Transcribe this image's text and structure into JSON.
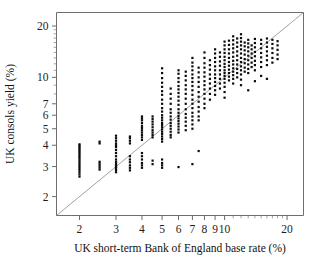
{
  "chart_data": {
    "type": "scatter",
    "title": "",
    "subtitle": "",
    "xlabel": "UK short-term Bank of England base rate (%)",
    "ylabel": "UK consols yield (%)",
    "xscale": "log",
    "yscale": "log",
    "xlim": [
      1.55,
      24.0
    ],
    "ylim": [
      1.55,
      24.0
    ],
    "grid": false,
    "legend": null,
    "legend_position": "none",
    "xticks": [
      2,
      3,
      4,
      5,
      6,
      7,
      8,
      9,
      10,
      20
    ],
    "xtick_labels": [
      "2",
      "3",
      "4",
      "5",
      "6",
      "7",
      "8",
      "9",
      "10",
      "20"
    ],
    "yticks": [
      2,
      3,
      4,
      5,
      6,
      7,
      10,
      20
    ],
    "ytick_labels": [
      "2",
      "3",
      "4",
      "5",
      "6",
      "7",
      "10",
      "20"
    ],
    "annotations": [
      {
        "kind": "reference-line",
        "label": "45-degree line (y = x)",
        "from": [
          1.55,
          1.55
        ],
        "to": [
          24.0,
          24.0
        ]
      }
    ],
    "marker": {
      "shape": "square",
      "color": "#0b0b0b",
      "size": 2.2
    },
    "points": [
      [
        2.0,
        2.62
      ],
      [
        2.0,
        2.7
      ],
      [
        2.0,
        2.78
      ],
      [
        2.0,
        2.86
      ],
      [
        2.0,
        2.94
      ],
      [
        2.0,
        3.02
      ],
      [
        2.0,
        3.1
      ],
      [
        2.0,
        3.18
      ],
      [
        2.0,
        3.26
      ],
      [
        2.0,
        3.34
      ],
      [
        2.0,
        3.42
      ],
      [
        2.0,
        3.5
      ],
      [
        2.0,
        3.58
      ],
      [
        2.0,
        3.66
      ],
      [
        2.0,
        3.74
      ],
      [
        2.0,
        3.82
      ],
      [
        2.0,
        3.9
      ],
      [
        2.0,
        3.98
      ],
      [
        2.0,
        4.05
      ],
      [
        2.5,
        2.88
      ],
      [
        2.5,
        2.96
      ],
      [
        2.5,
        3.04
      ],
      [
        2.5,
        3.12
      ],
      [
        2.5,
        3.2
      ],
      [
        2.5,
        4.1
      ],
      [
        2.5,
        4.2
      ],
      [
        3.0,
        2.78
      ],
      [
        3.0,
        2.86
      ],
      [
        3.0,
        2.94
      ],
      [
        3.0,
        3.0
      ],
      [
        3.0,
        3.05
      ],
      [
        3.0,
        3.12
      ],
      [
        3.0,
        3.2
      ],
      [
        3.0,
        3.3
      ],
      [
        3.0,
        3.45
      ],
      [
        3.0,
        3.6
      ],
      [
        3.0,
        3.75
      ],
      [
        3.0,
        3.9
      ],
      [
        3.0,
        4.0
      ],
      [
        3.0,
        4.1
      ],
      [
        3.0,
        4.25
      ],
      [
        3.0,
        4.4
      ],
      [
        3.0,
        4.55
      ],
      [
        3.5,
        2.85
      ],
      [
        3.5,
        2.95
      ],
      [
        3.5,
        3.05
      ],
      [
        3.5,
        3.18
      ],
      [
        3.5,
        3.3
      ],
      [
        3.5,
        3.45
      ],
      [
        3.5,
        4.1
      ],
      [
        3.5,
        4.25
      ],
      [
        3.5,
        4.4
      ],
      [
        3.5,
        4.5
      ],
      [
        4.0,
        2.95
      ],
      [
        4.0,
        3.05
      ],
      [
        4.0,
        3.15
      ],
      [
        4.0,
        3.3
      ],
      [
        4.0,
        3.45
      ],
      [
        4.0,
        3.6
      ],
      [
        4.0,
        4.3
      ],
      [
        4.0,
        4.45
      ],
      [
        4.0,
        4.6
      ],
      [
        4.0,
        4.75
      ],
      [
        4.0,
        4.9
      ],
      [
        4.0,
        5.05
      ],
      [
        4.0,
        5.2
      ],
      [
        4.0,
        5.4
      ],
      [
        4.0,
        5.6
      ],
      [
        4.0,
        5.75
      ],
      [
        4.0,
        5.9
      ],
      [
        4.5,
        3.1
      ],
      [
        4.5,
        3.25
      ],
      [
        4.5,
        4.45
      ],
      [
        4.5,
        4.6
      ],
      [
        4.5,
        4.75
      ],
      [
        4.5,
        4.9
      ],
      [
        4.5,
        5.1
      ],
      [
        4.5,
        5.3
      ],
      [
        4.5,
        5.5
      ],
      [
        4.5,
        5.7
      ],
      [
        4.5,
        5.9
      ],
      [
        5.0,
        2.95
      ],
      [
        5.0,
        3.05
      ],
      [
        5.0,
        3.15
      ],
      [
        5.0,
        3.3
      ],
      [
        5.0,
        4.2
      ],
      [
        5.0,
        4.35
      ],
      [
        5.0,
        4.5
      ],
      [
        5.0,
        4.65
      ],
      [
        5.0,
        4.8
      ],
      [
        5.0,
        4.95
      ],
      [
        5.0,
        5.1
      ],
      [
        5.0,
        5.25
      ],
      [
        5.0,
        5.4
      ],
      [
        5.0,
        5.6
      ],
      [
        5.0,
        5.8
      ],
      [
        5.0,
        6.0
      ],
      [
        5.0,
        6.3
      ],
      [
        5.0,
        6.6
      ],
      [
        5.0,
        7.0
      ],
      [
        5.0,
        7.4
      ],
      [
        5.0,
        7.9
      ],
      [
        5.0,
        8.3
      ],
      [
        5.0,
        8.8
      ],
      [
        5.0,
        9.3
      ],
      [
        5.0,
        9.9
      ],
      [
        5.0,
        10.6
      ],
      [
        5.0,
        11.3
      ],
      [
        5.5,
        4.45
      ],
      [
        5.5,
        4.6
      ],
      [
        5.5,
        4.8
      ],
      [
        5.5,
        5.0
      ],
      [
        5.5,
        5.2
      ],
      [
        5.5,
        5.4
      ],
      [
        5.5,
        5.65
      ],
      [
        5.5,
        5.9
      ],
      [
        5.5,
        6.2
      ],
      [
        5.5,
        6.5
      ],
      [
        5.5,
        7.0
      ],
      [
        5.5,
        7.5
      ],
      [
        5.5,
        8.0
      ],
      [
        5.5,
        8.6
      ],
      [
        6.0,
        2.98
      ],
      [
        6.0,
        4.75
      ],
      [
        6.0,
        4.95
      ],
      [
        6.0,
        5.15
      ],
      [
        6.0,
        5.35
      ],
      [
        6.0,
        5.55
      ],
      [
        6.0,
        5.75
      ],
      [
        6.0,
        5.95
      ],
      [
        6.0,
        6.2
      ],
      [
        6.0,
        6.5
      ],
      [
        6.0,
        6.9
      ],
      [
        6.0,
        7.3
      ],
      [
        6.0,
        7.7
      ],
      [
        6.0,
        8.1
      ],
      [
        6.0,
        8.5
      ],
      [
        6.0,
        8.9
      ],
      [
        6.0,
        9.4
      ],
      [
        6.0,
        9.9
      ],
      [
        6.0,
        10.5
      ],
      [
        6.0,
        11.0
      ],
      [
        6.5,
        4.9
      ],
      [
        6.5,
        5.2
      ],
      [
        6.5,
        5.5
      ],
      [
        6.5,
        5.8
      ],
      [
        6.5,
        6.1
      ],
      [
        6.5,
        6.5
      ],
      [
        6.5,
        7.0
      ],
      [
        6.5,
        7.5
      ],
      [
        6.5,
        8.0
      ],
      [
        6.5,
        8.5
      ],
      [
        6.5,
        9.0
      ],
      [
        6.5,
        9.6
      ],
      [
        6.5,
        10.2
      ],
      [
        6.5,
        10.8
      ],
      [
        7.0,
        3.1
      ],
      [
        7.0,
        5.0
      ],
      [
        7.0,
        5.3
      ],
      [
        7.0,
        5.6
      ],
      [
        7.0,
        5.9
      ],
      [
        7.0,
        6.2
      ],
      [
        7.0,
        6.6
      ],
      [
        7.0,
        7.0
      ],
      [
        7.0,
        7.4
      ],
      [
        7.0,
        7.9
      ],
      [
        7.0,
        8.4
      ],
      [
        7.0,
        8.9
      ],
      [
        7.0,
        9.4
      ],
      [
        7.0,
        9.9
      ],
      [
        7.0,
        10.4
      ],
      [
        7.0,
        11.0
      ],
      [
        7.0,
        11.6
      ],
      [
        7.0,
        12.2
      ],
      [
        7.0,
        13.0
      ],
      [
        7.5,
        3.7
      ],
      [
        7.5,
        5.6
      ],
      [
        7.5,
        5.9
      ],
      [
        7.5,
        6.3
      ],
      [
        7.5,
        6.7
      ],
      [
        7.5,
        7.2
      ],
      [
        7.5,
        7.7
      ],
      [
        7.5,
        8.2
      ],
      [
        7.5,
        8.8
      ],
      [
        7.5,
        9.4
      ],
      [
        7.5,
        10.0
      ],
      [
        7.5,
        10.7
      ],
      [
        7.5,
        11.4
      ],
      [
        8.0,
        6.6
      ],
      [
        8.0,
        7.0
      ],
      [
        8.0,
        7.5
      ],
      [
        8.0,
        8.0
      ],
      [
        8.0,
        8.5
      ],
      [
        8.0,
        9.0
      ],
      [
        8.0,
        9.5
      ],
      [
        8.0,
        10.1
      ],
      [
        8.0,
        10.7
      ],
      [
        8.0,
        11.4
      ],
      [
        8.0,
        12.1
      ],
      [
        8.0,
        13.0
      ],
      [
        8.0,
        14.0
      ],
      [
        8.5,
        7.4
      ],
      [
        8.5,
        8.0
      ],
      [
        8.5,
        8.6
      ],
      [
        8.5,
        9.2
      ],
      [
        8.5,
        9.8
      ],
      [
        8.5,
        10.4
      ],
      [
        8.5,
        11.1
      ],
      [
        8.5,
        11.8
      ],
      [
        8.5,
        12.6
      ],
      [
        9.0,
        7.9
      ],
      [
        9.0,
        8.4
      ],
      [
        9.0,
        8.9
      ],
      [
        9.0,
        9.4
      ],
      [
        9.0,
        9.9
      ],
      [
        9.0,
        10.4
      ],
      [
        9.0,
        11.0
      ],
      [
        9.0,
        11.6
      ],
      [
        9.0,
        12.3
      ],
      [
        9.0,
        13.0
      ],
      [
        9.0,
        13.8
      ],
      [
        9.0,
        14.6
      ],
      [
        9.5,
        8.6
      ],
      [
        9.5,
        9.2
      ],
      [
        9.5,
        9.8
      ],
      [
        9.5,
        10.4
      ],
      [
        9.5,
        11.0
      ],
      [
        9.5,
        11.7
      ],
      [
        9.5,
        12.4
      ],
      [
        9.5,
        13.2
      ],
      [
        9.5,
        14.0
      ],
      [
        10.0,
        7.6
      ],
      [
        10.0,
        8.2
      ],
      [
        10.0,
        8.8
      ],
      [
        10.0,
        9.3
      ],
      [
        10.0,
        9.8
      ],
      [
        10.0,
        10.2
      ],
      [
        10.0,
        10.6
      ],
      [
        10.0,
        11.0
      ],
      [
        10.0,
        11.5
      ],
      [
        10.0,
        12.0
      ],
      [
        10.0,
        12.6
      ],
      [
        10.0,
        13.2
      ],
      [
        10.0,
        13.9
      ],
      [
        10.0,
        14.6
      ],
      [
        10.0,
        15.4
      ],
      [
        10.0,
        16.2
      ],
      [
        10.5,
        9.6
      ],
      [
        10.5,
        10.1
      ],
      [
        10.5,
        10.6
      ],
      [
        10.5,
        11.1
      ],
      [
        10.5,
        11.7
      ],
      [
        10.5,
        12.3
      ],
      [
        10.5,
        13.0
      ],
      [
        10.5,
        13.8
      ],
      [
        10.5,
        14.6
      ],
      [
        10.5,
        15.5
      ],
      [
        10.5,
        16.4
      ],
      [
        11.0,
        9.2
      ],
      [
        11.0,
        9.8
      ],
      [
        11.0,
        10.3
      ],
      [
        11.0,
        10.8
      ],
      [
        11.0,
        11.3
      ],
      [
        11.0,
        11.9
      ],
      [
        11.0,
        12.5
      ],
      [
        11.0,
        13.2
      ],
      [
        11.0,
        14.0
      ],
      [
        11.0,
        14.8
      ],
      [
        11.0,
        15.6
      ],
      [
        11.0,
        16.5
      ],
      [
        11.0,
        17.4
      ],
      [
        11.5,
        10.0
      ],
      [
        11.5,
        10.6
      ],
      [
        11.5,
        11.2
      ],
      [
        11.5,
        11.9
      ],
      [
        11.5,
        12.6
      ],
      [
        11.5,
        13.4
      ],
      [
        11.5,
        14.2
      ],
      [
        11.5,
        15.1
      ],
      [
        11.5,
        16.0
      ],
      [
        11.5,
        16.9
      ],
      [
        12.0,
        9.0
      ],
      [
        12.0,
        9.7
      ],
      [
        12.0,
        10.4
      ],
      [
        12.0,
        11.0
      ],
      [
        12.0,
        11.6
      ],
      [
        12.0,
        12.3
      ],
      [
        12.0,
        13.0
      ],
      [
        12.0,
        13.8
      ],
      [
        12.0,
        14.6
      ],
      [
        12.0,
        15.4
      ],
      [
        12.0,
        16.2
      ],
      [
        12.0,
        17.0
      ],
      [
        12.0,
        17.9
      ],
      [
        12.5,
        10.8
      ],
      [
        12.5,
        11.4
      ],
      [
        12.5,
        12.1
      ],
      [
        12.5,
        12.8
      ],
      [
        12.5,
        13.6
      ],
      [
        12.5,
        14.4
      ],
      [
        12.5,
        15.2
      ],
      [
        12.5,
        16.0
      ],
      [
        13.0,
        8.4
      ],
      [
        13.0,
        10.6
      ],
      [
        13.0,
        11.2
      ],
      [
        13.0,
        11.9
      ],
      [
        13.0,
        12.6
      ],
      [
        13.0,
        13.4
      ],
      [
        13.0,
        14.2
      ],
      [
        13.0,
        15.0
      ],
      [
        13.0,
        15.8
      ],
      [
        13.0,
        16.6
      ],
      [
        13.5,
        11.5
      ],
      [
        13.5,
        12.2
      ],
      [
        13.5,
        13.0
      ],
      [
        13.5,
        13.8
      ],
      [
        13.5,
        14.6
      ],
      [
        13.5,
        15.4
      ],
      [
        14.0,
        9.5
      ],
      [
        14.0,
        11.0
      ],
      [
        14.0,
        11.8
      ],
      [
        14.0,
        12.5
      ],
      [
        14.0,
        13.3
      ],
      [
        14.0,
        14.1
      ],
      [
        14.0,
        15.0
      ],
      [
        14.0,
        15.9
      ],
      [
        14.0,
        16.8
      ],
      [
        15.0,
        10.2
      ],
      [
        15.0,
        11.5
      ],
      [
        15.0,
        12.3
      ],
      [
        15.0,
        13.1
      ],
      [
        15.0,
        13.9
      ],
      [
        15.0,
        14.8
      ],
      [
        15.0,
        15.7
      ],
      [
        15.0,
        16.6
      ],
      [
        16.0,
        9.8
      ],
      [
        16.0,
        11.8
      ],
      [
        16.0,
        12.6
      ],
      [
        16.0,
        13.4
      ],
      [
        16.0,
        14.2
      ],
      [
        16.0,
        15.1
      ],
      [
        16.0,
        16.0
      ],
      [
        16.0,
        16.9
      ],
      [
        17.0,
        12.2
      ],
      [
        17.0,
        13.0
      ],
      [
        17.0,
        13.9
      ],
      [
        17.0,
        14.8
      ],
      [
        17.0,
        15.7
      ],
      [
        17.0,
        16.6
      ],
      [
        18.0,
        12.8
      ],
      [
        18.0,
        13.6
      ],
      [
        18.0,
        14.5
      ],
      [
        18.0,
        15.4
      ],
      [
        18.0,
        16.3
      ]
    ]
  }
}
